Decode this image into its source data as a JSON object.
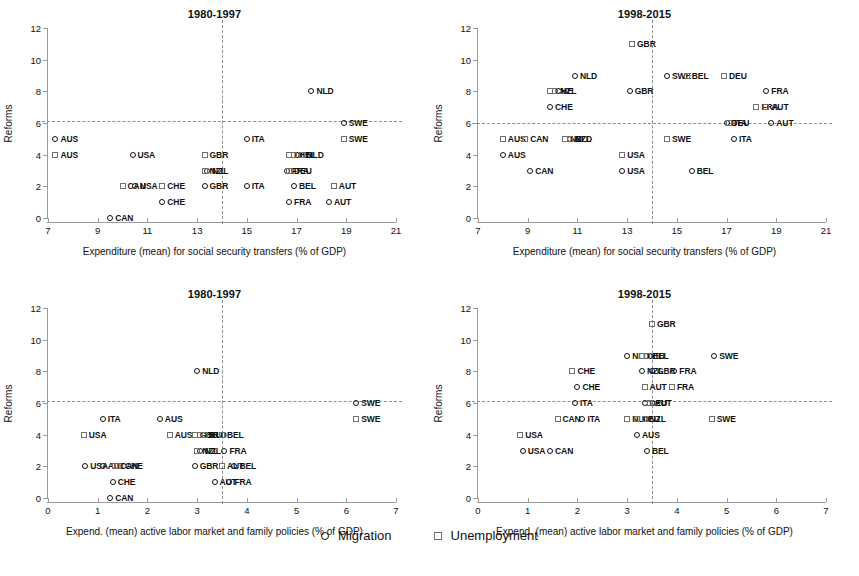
{
  "figure": {
    "legend": [
      {
        "marker": "circle",
        "label": "Migration"
      },
      {
        "marker": "square",
        "label": "Unemployment"
      }
    ]
  },
  "chart_data": [
    {
      "type": "scatter",
      "panel": "top-left",
      "title": "1980-1997",
      "xlabel": "Expenditure (mean) for social security transfers (% of GDP)",
      "ylabel": "Reforms",
      "xlim": [
        7,
        21
      ],
      "ylim": [
        0,
        12
      ],
      "xticks": [
        7,
        9,
        11,
        13,
        15,
        17,
        19,
        21
      ],
      "yticks": [
        0,
        2,
        4,
        6,
        8,
        10,
        12
      ],
      "grid": false,
      "reference_lines": {
        "horizontal": 6.1,
        "vertical": 14.0
      },
      "series": [
        {
          "name": "Migration",
          "marker": "circle",
          "points": [
            {
              "label": "AUS",
              "x": 7.3,
              "y": 5
            },
            {
              "label": "USA",
              "x": 10.4,
              "y": 4
            },
            {
              "label": "ITA",
              "x": 15.0,
              "y": 5
            },
            {
              "label": "NLD",
              "x": 17.6,
              "y": 8
            },
            {
              "label": "SWE",
              "x": 18.9,
              "y": 6
            },
            {
              "label": "NZL",
              "x": 13.4,
              "y": 3
            },
            {
              "label": "GBR",
              "x": 13.3,
              "y": 2
            },
            {
              "label": "ITA",
              "x": 15.0,
              "y": 2
            },
            {
              "label": "BEL",
              "x": 16.9,
              "y": 2
            },
            {
              "label": "AUT",
              "x": 18.3,
              "y": 1
            },
            {
              "label": "FRA",
              "x": 16.7,
              "y": 1
            },
            {
              "label": "CHE",
              "x": 11.6,
              "y": 1
            },
            {
              "label": "USA",
              "x": 10.5,
              "y": 2
            },
            {
              "label": "CAN",
              "x": 9.5,
              "y": 0
            },
            {
              "label": "FRA",
              "x": 16.6,
              "y": 3
            }
          ]
        },
        {
          "name": "Unemployment",
          "marker": "square",
          "points": [
            {
              "label": "AUS",
              "x": 7.3,
              "y": 4
            },
            {
              "label": "GBR",
              "x": 13.3,
              "y": 4
            },
            {
              "label": "DEU",
              "x": 16.7,
              "y": 4
            },
            {
              "label": "BEL",
              "x": 16.9,
              "y": 4
            },
            {
              "label": "NLD",
              "x": 17.2,
              "y": 4
            },
            {
              "label": "SWE",
              "x": 18.9,
              "y": 5
            },
            {
              "label": "NZL",
              "x": 13.3,
              "y": 3
            },
            {
              "label": "CHE",
              "x": 11.6,
              "y": 2
            },
            {
              "label": "CAN",
              "x": 10.0,
              "y": 2
            },
            {
              "label": "AUT",
              "x": 18.5,
              "y": 2
            },
            {
              "label": "DEU",
              "x": 16.7,
              "y": 3
            }
          ]
        }
      ]
    },
    {
      "type": "scatter",
      "panel": "top-right",
      "title": "1998-2015",
      "xlabel": "Expenditure (mean) for social security transfers (% of GDP)",
      "ylabel": "Reforms",
      "xlim": [
        7,
        21
      ],
      "ylim": [
        0,
        12
      ],
      "xticks": [
        7,
        9,
        11,
        13,
        15,
        17,
        19,
        21
      ],
      "yticks": [
        0,
        2,
        4,
        6,
        8,
        10,
        12
      ],
      "grid": false,
      "reference_lines": {
        "horizontal": 6.0,
        "vertical": 14.0
      },
      "series": [
        {
          "name": "Migration",
          "marker": "circle",
          "points": [
            {
              "label": "NLD",
              "x": 10.9,
              "y": 9
            },
            {
              "label": "SWE",
              "x": 14.6,
              "y": 9
            },
            {
              "label": "GBR",
              "x": 13.1,
              "y": 8
            },
            {
              "label": "CHE",
              "x": 9.9,
              "y": 7
            },
            {
              "label": "FRA",
              "x": 18.6,
              "y": 8
            },
            {
              "label": "DEU",
              "x": 17.0,
              "y": 6
            },
            {
              "label": "AUT",
              "x": 18.8,
              "y": 6
            },
            {
              "label": "ITA",
              "x": 17.3,
              "y": 5
            },
            {
              "label": "AUS",
              "x": 8.0,
              "y": 4
            },
            {
              "label": "CAN",
              "x": 9.1,
              "y": 3
            },
            {
              "label": "USA",
              "x": 12.8,
              "y": 3
            },
            {
              "label": "BEL",
              "x": 15.6,
              "y": 3
            },
            {
              "label": "NZL",
              "x": 10.7,
              "y": 5
            }
          ]
        },
        {
          "name": "Unemployment",
          "marker": "square",
          "points": [
            {
              "label": "GBR",
              "x": 13.2,
              "y": 11
            },
            {
              "label": "BEL",
              "x": 15.4,
              "y": 9
            },
            {
              "label": "DEU",
              "x": 16.9,
              "y": 9
            },
            {
              "label": "CHE",
              "x": 9.9,
              "y": 8
            },
            {
              "label": "NZL",
              "x": 10.1,
              "y": 8
            },
            {
              "label": "FRA",
              "x": 18.2,
              "y": 7
            },
            {
              "label": "AUT",
              "x": 18.6,
              "y": 7
            },
            {
              "label": "ITA",
              "x": 17.1,
              "y": 6
            },
            {
              "label": "AUS",
              "x": 8.0,
              "y": 5
            },
            {
              "label": "CAN",
              "x": 8.9,
              "y": 5
            },
            {
              "label": "NZL",
              "x": 10.5,
              "y": 5
            },
            {
              "label": "NLD",
              "x": 10.7,
              "y": 5
            },
            {
              "label": "SWE",
              "x": 14.6,
              "y": 5
            },
            {
              "label": "USA",
              "x": 12.8,
              "y": 4
            }
          ]
        }
      ]
    },
    {
      "type": "scatter",
      "panel": "bottom-left",
      "title": "1980-1997",
      "xlabel": "Expend. (mean) active labor market and family policies (% of GDP)",
      "ylabel": "Reforms",
      "xlim": [
        0,
        7
      ],
      "ylim": [
        0,
        12
      ],
      "xticks": [
        0,
        1,
        2,
        3,
        4,
        5,
        6,
        7
      ],
      "yticks": [
        0,
        2,
        4,
        6,
        8,
        10,
        12
      ],
      "grid": false,
      "reference_lines": {
        "horizontal": 6.1,
        "vertical": 3.5
      },
      "series": [
        {
          "name": "Migration",
          "marker": "circle",
          "points": [
            {
              "label": "NLD",
              "x": 3.0,
              "y": 8
            },
            {
              "label": "SWE",
              "x": 6.2,
              "y": 6
            },
            {
              "label": "ITA",
              "x": 1.1,
              "y": 5
            },
            {
              "label": "AUS",
              "x": 2.25,
              "y": 5
            },
            {
              "label": "NZL",
              "x": 3.05,
              "y": 3
            },
            {
              "label": "FRA",
              "x": 3.55,
              "y": 3
            },
            {
              "label": "GBR",
              "x": 2.95,
              "y": 2
            },
            {
              "label": "BEL",
              "x": 3.75,
              "y": 2
            },
            {
              "label": "AUT",
              "x": 3.35,
              "y": 1
            },
            {
              "label": "FRA",
              "x": 3.65,
              "y": 1
            },
            {
              "label": "CHE",
              "x": 1.3,
              "y": 1
            },
            {
              "label": "USA",
              "x": 0.75,
              "y": 2
            },
            {
              "label": "CAN",
              "x": 1.25,
              "y": 0
            },
            {
              "label": "AUT",
              "x": 1.1,
              "y": 2
            }
          ]
        },
        {
          "name": "Unemployment",
          "marker": "square",
          "points": [
            {
              "label": "SWE",
              "x": 6.2,
              "y": 5
            },
            {
              "label": "USA",
              "x": 0.72,
              "y": 4
            },
            {
              "label": "AUS",
              "x": 2.45,
              "y": 4
            },
            {
              "label": "GBR",
              "x": 2.95,
              "y": 4
            },
            {
              "label": "DEU",
              "x": 3.05,
              "y": 4
            },
            {
              "label": "NLD",
              "x": 3.15,
              "y": 4
            },
            {
              "label": "BEL",
              "x": 3.5,
              "y": 4
            },
            {
              "label": "NZL",
              "x": 3.0,
              "y": 3
            },
            {
              "label": "CHE",
              "x": 1.45,
              "y": 2
            },
            {
              "label": "CAN",
              "x": 1.35,
              "y": 2
            },
            {
              "label": "AUT",
              "x": 3.5,
              "y": 2
            }
          ]
        }
      ]
    },
    {
      "type": "scatter",
      "panel": "bottom-right",
      "title": "1998-2015",
      "xlabel": "Expend. (mean) active labor market and family policies (% of GDP)",
      "ylabel": "Reforms",
      "xlim": [
        0,
        7
      ],
      "ylim": [
        0,
        12
      ],
      "xticks": [
        0,
        1,
        2,
        3,
        4,
        5,
        6,
        7
      ],
      "yticks": [
        0,
        2,
        4,
        6,
        8,
        10,
        12
      ],
      "grid": false,
      "reference_lines": {
        "horizontal": 6.1,
        "vertical": 3.5
      },
      "series": [
        {
          "name": "Migration",
          "marker": "circle",
          "points": [
            {
              "label": "NLD",
              "x": 3.0,
              "y": 9
            },
            {
              "label": "SWE",
              "x": 4.75,
              "y": 9
            },
            {
              "label": "NZL",
              "x": 3.3,
              "y": 8
            },
            {
              "label": "FRA",
              "x": 3.95,
              "y": 8
            },
            {
              "label": "CHE",
              "x": 2.0,
              "y": 7
            },
            {
              "label": "ITA",
              "x": 1.95,
              "y": 6
            },
            {
              "label": "DEU",
              "x": 3.35,
              "y": 6
            },
            {
              "label": "ITA",
              "x": 2.1,
              "y": 5
            },
            {
              "label": "AUS",
              "x": 3.2,
              "y": 4
            },
            {
              "label": "USA",
              "x": 0.9,
              "y": 3
            },
            {
              "label": "CAN",
              "x": 1.45,
              "y": 3
            },
            {
              "label": "BEL",
              "x": 3.4,
              "y": 3
            },
            {
              "label": "GBR",
              "x": 3.5,
              "y": 8
            }
          ]
        },
        {
          "name": "Unemployment",
          "marker": "square",
          "points": [
            {
              "label": "GBR",
              "x": 3.5,
              "y": 11
            },
            {
              "label": "DEU",
              "x": 3.3,
              "y": 9
            },
            {
              "label": "BEL",
              "x": 3.4,
              "y": 9
            },
            {
              "label": "CHE",
              "x": 1.9,
              "y": 8
            },
            {
              "label": "AUT",
              "x": 3.35,
              "y": 7
            },
            {
              "label": "FRA",
              "x": 3.9,
              "y": 7
            },
            {
              "label": "AUT",
              "x": 3.45,
              "y": 6
            },
            {
              "label": "CAN",
              "x": 1.6,
              "y": 5
            },
            {
              "label": "NLD",
              "x": 3.0,
              "y": 5
            },
            {
              "label": "DEU",
              "x": 3.2,
              "y": 5
            },
            {
              "label": "NZL",
              "x": 3.35,
              "y": 5
            },
            {
              "label": "SWE",
              "x": 4.7,
              "y": 5
            },
            {
              "label": "USA",
              "x": 0.85,
              "y": 4
            }
          ]
        }
      ]
    }
  ]
}
